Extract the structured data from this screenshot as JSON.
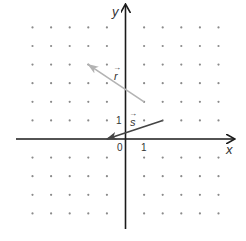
{
  "diagram": {
    "type": "coordinate-plane-vectors",
    "axes": {
      "x_label": "x",
      "y_label": "y",
      "origin_label": "0",
      "x_tick_label": "1",
      "y_tick_label": "1",
      "x_range": [
        -5,
        6
      ],
      "y_range": [
        -4,
        6
      ],
      "axis_color": "#1a1a1a"
    },
    "grid": {
      "style": "dots",
      "x_dots": [
        -5,
        -4,
        -3,
        -2,
        -1,
        1,
        2,
        3,
        4,
        5
      ],
      "y_dots": [
        -4,
        -3,
        -2,
        -1,
        1,
        2,
        3,
        4,
        5,
        6
      ],
      "dot_color": "#8a8a8a"
    },
    "vectors": [
      {
        "name": "r",
        "label": "r",
        "label_arrow": "→",
        "tail": [
          1,
          2
        ],
        "head": [
          -2,
          4
        ],
        "color": "#b3b3b3"
      },
      {
        "name": "s",
        "label": "s",
        "label_arrow": "→",
        "tail": [
          2,
          1
        ],
        "head": [
          -1,
          0
        ],
        "color": "#444444"
      }
    ]
  }
}
